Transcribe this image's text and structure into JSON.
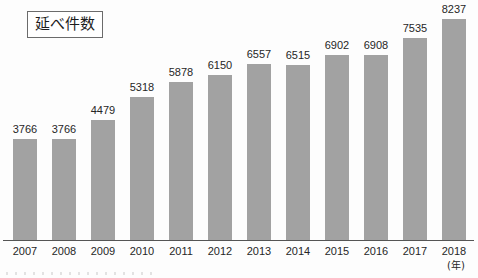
{
  "title": {
    "label": "延べ件数"
  },
  "axis": {
    "unit_label": "(年)"
  },
  "chart_data": {
    "type": "bar",
    "title": "延べ件数",
    "xlabel": "(年)",
    "ylabel": "",
    "grid": false,
    "legend": "none",
    "ylim": [
      0,
      8237
    ],
    "categories": [
      "2007",
      "2008",
      "2009",
      "2010",
      "2011",
      "2012",
      "2013",
      "2014",
      "2015",
      "2016",
      "2017",
      "2018"
    ],
    "values": [
      3766,
      3766,
      4479,
      5318,
      5878,
      6150,
      6557,
      6515,
      6902,
      6908,
      7535,
      8237
    ],
    "value_labels": [
      "3766",
      "3766",
      "4479",
      "5318",
      "5878",
      "6150",
      "6557",
      "6515",
      "6902",
      "6908",
      "7535",
      "8237"
    ],
    "bar_color": "#a2a2a2",
    "axis_color": "#555555",
    "text_color": "#262626"
  }
}
